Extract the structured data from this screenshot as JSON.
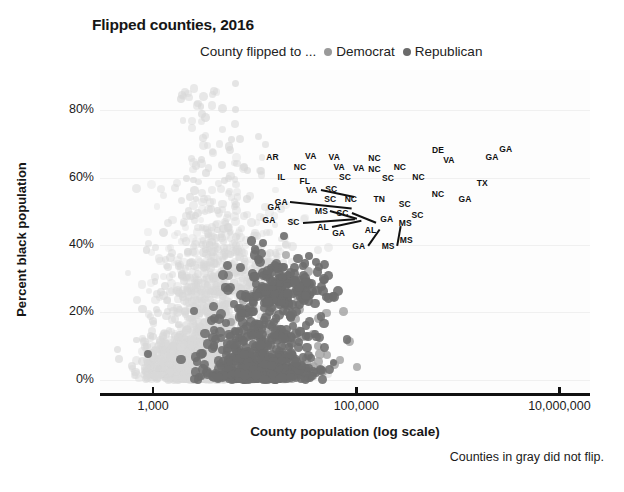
{
  "chart_data": {
    "type": "scatter",
    "title": "Flipped counties, 2016",
    "subtitle": "",
    "xlabel": "County population (log scale)",
    "ylabel": "Percent black population",
    "footnote": "Counties in gray did not flip.",
    "legend": {
      "prefix": "County flipped to ...",
      "position": "top-center",
      "entries": [
        {
          "name": "Democrat",
          "color": "#9a9a9a"
        },
        {
          "name": "Republican",
          "color": "#6b6b6b"
        }
      ]
    },
    "grid": true,
    "xscale": "log",
    "xlim": [
      300,
      20000000
    ],
    "ylim": [
      -0.04,
      0.92
    ],
    "xticks": [
      1000,
      100000,
      10000000
    ],
    "xticklabels": [
      "1,000",
      "100,000",
      "10,000,000"
    ],
    "yticks": [
      0,
      0.2,
      0.4,
      0.6,
      0.8
    ],
    "yticklabels": [
      "0%",
      "20%",
      "40%",
      "60%",
      "80%"
    ],
    "colors": {
      "not_flipped": "#d8d8d8",
      "flipped_republican": "#6e6e6e",
      "flipped_democrat": "#a0a0a0",
      "axis": "#111111",
      "text": "#1a1a1a"
    },
    "series": [
      {
        "name": "Counties that did not flip",
        "color": "#d8d8d8",
        "marker_size": 7,
        "opacity": 0.55,
        "note": "Dense gray cloud spanning full population range, concentrated at low percent-black values and rising tail at mid populations"
      },
      {
        "name": "Counties flipped to Republican",
        "color": "#6e6e6e",
        "marker_size": 8,
        "opacity": 0.9,
        "note": "Dark dots clustered between 3,000 and 1,000,000 population, percent black 0% to 55%"
      },
      {
        "name": "Counties flipped to Democrat",
        "color": "#a0a0a0",
        "marker_size": 8,
        "opacity": 0.85,
        "note": "Fewer mid-gray dots scattered among the dark ones"
      }
    ],
    "annotations": [
      {
        "label": "GA",
        "x": 0.345,
        "y": 0.465,
        "leader": false
      },
      {
        "label": "GA",
        "x": 0.355,
        "y": 0.425,
        "leader": false
      },
      {
        "label": "SC",
        "x": 0.395,
        "y": 0.472,
        "leader": true,
        "leader_len": 52,
        "leader_angle": 4
      },
      {
        "label": "AL",
        "x": 0.455,
        "y": 0.485,
        "leader": true,
        "leader_len": 30,
        "leader_angle": 12
      },
      {
        "label": "GA",
        "x": 0.487,
        "y": 0.505,
        "leader": false
      },
      {
        "label": "GA",
        "x": 0.528,
        "y": 0.545,
        "leader": true,
        "leader_len": 20,
        "leader_angle": 55
      },
      {
        "label": "AL",
        "x": 0.552,
        "y": 0.495,
        "leader": false
      },
      {
        "label": "MS",
        "x": 0.588,
        "y": 0.545,
        "leader": true,
        "leader_len": 20,
        "leader_angle": 80
      },
      {
        "label": "MS",
        "x": 0.625,
        "y": 0.525,
        "leader": false
      },
      {
        "label": "MS",
        "x": 0.623,
        "y": 0.475,
        "leader": false
      },
      {
        "label": "GA",
        "x": 0.585,
        "y": 0.462,
        "leader": false
      },
      {
        "label": "MS",
        "x": 0.452,
        "y": 0.437,
        "leader": true,
        "leader_len": 28,
        "leader_angle": -16
      },
      {
        "label": "SC",
        "x": 0.495,
        "y": 0.443,
        "leader": true,
        "leader_len": 26,
        "leader_angle": -22
      },
      {
        "label": "GA",
        "x": 0.37,
        "y": 0.408,
        "leader": true,
        "leader_len": 62,
        "leader_angle": -6
      },
      {
        "label": "SC",
        "x": 0.47,
        "y": 0.4,
        "leader": false
      },
      {
        "label": "NC",
        "x": 0.512,
        "y": 0.398,
        "leader": false
      },
      {
        "label": "TN",
        "x": 0.57,
        "y": 0.398,
        "leader": false
      },
      {
        "label": "SC",
        "x": 0.622,
        "y": 0.415,
        "leader": false
      },
      {
        "label": "SC",
        "x": 0.648,
        "y": 0.448,
        "leader": false
      },
      {
        "label": "VA",
        "x": 0.432,
        "y": 0.372,
        "leader": true,
        "leader_len": 34,
        "leader_angle": -12
      },
      {
        "label": "SC",
        "x": 0.472,
        "y": 0.369,
        "leader": false
      },
      {
        "label": "NC",
        "x": 0.69,
        "y": 0.385,
        "leader": false
      },
      {
        "label": "GA",
        "x": 0.745,
        "y": 0.4,
        "leader": false
      },
      {
        "label": "IL",
        "x": 0.37,
        "y": 0.33,
        "leader": false
      },
      {
        "label": "FL",
        "x": 0.418,
        "y": 0.343,
        "leader": false
      },
      {
        "label": "SC",
        "x": 0.5,
        "y": 0.332,
        "leader": false
      },
      {
        "label": "SC",
        "x": 0.588,
        "y": 0.335,
        "leader": false
      },
      {
        "label": "NC",
        "x": 0.65,
        "y": 0.33,
        "leader": false
      },
      {
        "label": "TX",
        "x": 0.78,
        "y": 0.35,
        "leader": false
      },
      {
        "label": "NC",
        "x": 0.408,
        "y": 0.3,
        "leader": false
      },
      {
        "label": "VA",
        "x": 0.488,
        "y": 0.3,
        "leader": false
      },
      {
        "label": "VA",
        "x": 0.528,
        "y": 0.303,
        "leader": false
      },
      {
        "label": "NC",
        "x": 0.56,
        "y": 0.305,
        "leader": false
      },
      {
        "label": "NC",
        "x": 0.612,
        "y": 0.3,
        "leader": false
      },
      {
        "label": "AR",
        "x": 0.352,
        "y": 0.268,
        "leader": false
      },
      {
        "label": "VA",
        "x": 0.43,
        "y": 0.265,
        "leader": false
      },
      {
        "label": "VA",
        "x": 0.478,
        "y": 0.268,
        "leader": false
      },
      {
        "label": "NC",
        "x": 0.56,
        "y": 0.272,
        "leader": false
      },
      {
        "label": "VA",
        "x": 0.712,
        "y": 0.28,
        "leader": false
      },
      {
        "label": "GA",
        "x": 0.8,
        "y": 0.27,
        "leader": false
      },
      {
        "label": "DE",
        "x": 0.69,
        "y": 0.248,
        "leader": false
      },
      {
        "label": "GA",
        "x": 0.828,
        "y": 0.245,
        "leader": false
      }
    ]
  }
}
